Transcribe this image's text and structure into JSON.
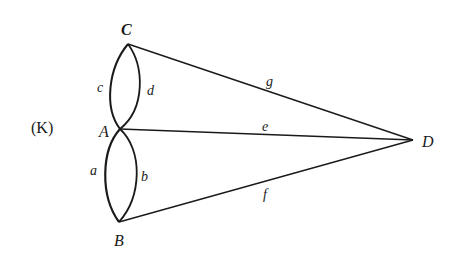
{
  "figure": {
    "label": "(K)"
  },
  "nodes": {
    "C": {
      "label": "C",
      "x": 128,
      "y": 44
    },
    "A": {
      "label": "A",
      "x": 120,
      "y": 129
    },
    "B": {
      "label": "B",
      "x": 119,
      "y": 222
    },
    "D": {
      "label": "D",
      "x": 413,
      "y": 140
    }
  },
  "edges": {
    "c": {
      "label": "c",
      "from": "C",
      "to": "A",
      "shape": "arc-left"
    },
    "d": {
      "label": "d",
      "from": "C",
      "to": "A",
      "shape": "arc-right"
    },
    "a": {
      "label": "a",
      "from": "A",
      "to": "B",
      "shape": "arc-left"
    },
    "b": {
      "label": "b",
      "from": "A",
      "to": "B",
      "shape": "arc-right"
    },
    "g": {
      "label": "g",
      "from": "C",
      "to": "D",
      "shape": "line"
    },
    "e": {
      "label": "e",
      "from": "A",
      "to": "D",
      "shape": "line"
    },
    "f": {
      "label": "f",
      "from": "B",
      "to": "D",
      "shape": "line"
    }
  },
  "colors": {
    "ink": "#1a1a1a",
    "background": "#ffffff"
  }
}
